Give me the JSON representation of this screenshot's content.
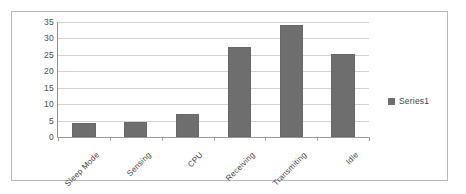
{
  "chart_data": {
    "type": "bar",
    "title": "",
    "subtitle": "",
    "xlabel": "",
    "ylabel": "",
    "categories": [
      "Sleep Mode",
      "Sensing",
      "CPU",
      "Receiving",
      "Transmiting",
      "Idle"
    ],
    "values": [
      4.4,
      4.7,
      7.0,
      27.3,
      34.2,
      25.3
    ],
    "series": [
      {
        "name": "Series1",
        "values": [
          4.4,
          4.7,
          7.0,
          27.3,
          34.2,
          25.3
        ]
      }
    ],
    "ylim": [
      0,
      35
    ],
    "yticks": [
      0,
      5,
      10,
      15,
      20,
      25,
      30,
      35
    ],
    "ytick_labels": [
      "0",
      "5",
      "10",
      "15",
      "20",
      "25",
      "30",
      "35"
    ],
    "grid": true,
    "grid_axis": "y",
    "legend": {
      "position": "right",
      "entries": [
        "Series1"
      ]
    },
    "annotations": [],
    "colors": {
      "bar": "#6e6e6e",
      "gridline": "#d2d2d2",
      "axis": "#8d8d8d",
      "text": "#3f3f3f",
      "frame_border": "#b9b9b9",
      "plot_background": "#ffffff"
    },
    "xlabel_rotation_deg": -45
  },
  "legend_entry_label": "Series1"
}
